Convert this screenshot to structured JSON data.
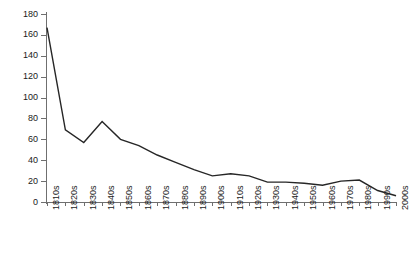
{
  "chart_data": {
    "type": "line",
    "title": "",
    "xlabel": "",
    "ylabel": "",
    "categories": [
      "1810s",
      "1820s",
      "1830s",
      "1840s",
      "1850s",
      "1860s",
      "1870s",
      "1880s",
      "1890s",
      "1900s",
      "1910s",
      "1920s",
      "1930s",
      "1940s",
      "1950s",
      "1960s",
      "1970s",
      "1980s",
      "1990s",
      "2000s"
    ],
    "values": [
      167,
      69,
      57,
      77,
      60,
      54,
      45,
      38,
      31,
      25,
      27,
      25,
      19,
      19,
      18,
      16,
      20,
      21,
      11,
      6
    ],
    "series": [
      {
        "name": "",
        "values": [
          167,
          69,
          57,
          77,
          60,
          54,
          45,
          38,
          31,
          25,
          27,
          25,
          19,
          19,
          18,
          16,
          20,
          21,
          11,
          6
        ]
      }
    ],
    "ylim": [
      0,
      180
    ],
    "ytick_values": [
      0,
      20,
      40,
      60,
      80,
      100,
      120,
      140,
      160,
      180
    ],
    "ytick_labels": [
      "0",
      "20",
      "40",
      "60",
      "80",
      "100",
      "120",
      "140",
      "160",
      "180"
    ],
    "grid": false,
    "legend": false,
    "legend_position": "none",
    "line_color": "#262626",
    "axis_color": "#6f6f6f",
    "background_color": "#ffffff"
  }
}
